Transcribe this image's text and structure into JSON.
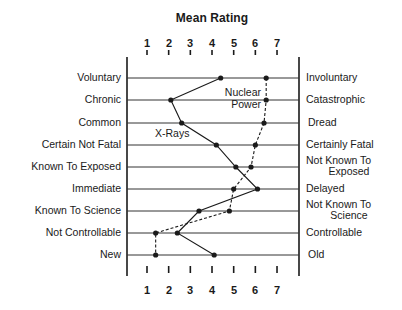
{
  "chart_data": {
    "type": "line",
    "title": "Mean Rating",
    "xlabel": "Mean Rating",
    "x_ticks": [
      1,
      2,
      3,
      4,
      5,
      6,
      7
    ],
    "xlim": [
      1,
      7
    ],
    "orientation": "horizontal-profile",
    "grid": true,
    "categories_left": [
      "Voluntary",
      "Chronic",
      "Common",
      "Certain Not Fatal",
      "Known To Exposed",
      "Immediate",
      "Known To Science",
      "Not Controllable",
      "New"
    ],
    "categories_right": [
      "Involuntary",
      "Catastrophic",
      "Dread",
      "Certainly Fatal",
      "Not Known To Exposed",
      "Delayed",
      "Not Known To Science",
      "Controllable",
      "Old"
    ],
    "series": [
      {
        "name": "X-Rays",
        "style": "solid",
        "values": [
          4.4,
          2.1,
          2.6,
          4.2,
          5.1,
          6.1,
          3.4,
          2.4,
          4.1
        ]
      },
      {
        "name": "Nuclear Power",
        "style": "dashed",
        "values": [
          6.5,
          6.5,
          6.4,
          6.0,
          5.8,
          5.0,
          4.8,
          1.4,
          1.4
        ]
      }
    ],
    "legend": "inline labels"
  },
  "header": {
    "title": "Mean Rating"
  },
  "ticks": [
    "1",
    "2",
    "3",
    "4",
    "5",
    "6",
    "7"
  ],
  "rows": [
    {
      "left": "Voluntary",
      "right1": "Involuntary",
      "right2": ""
    },
    {
      "left": "Chronic",
      "right1": "Catastrophic",
      "right2": ""
    },
    {
      "left": "Common",
      "right1": "Dread",
      "right2": ""
    },
    {
      "left": "Certain Not Fatal",
      "right1": "Certainly Fatal",
      "right2": ""
    },
    {
      "left": "Known To Exposed",
      "right1": "Not Known To",
      "right2": "Exposed"
    },
    {
      "left": "Immediate",
      "right1": "Delayed",
      "right2": ""
    },
    {
      "left": "Known To Science",
      "right1": "Not Known To",
      "right2": "Science"
    },
    {
      "left": "Not Controllable",
      "right1": "Controllable",
      "right2": ""
    },
    {
      "left": "New",
      "right1": "Old",
      "right2": ""
    }
  ],
  "labels": {
    "nuclear_line1": "Nuclear",
    "nuclear_line2": "Power",
    "xrays": "X-Rays"
  },
  "colors": {
    "ink": "#1a1a1a",
    "grid": "#333333",
    "background": "#ffffff"
  }
}
